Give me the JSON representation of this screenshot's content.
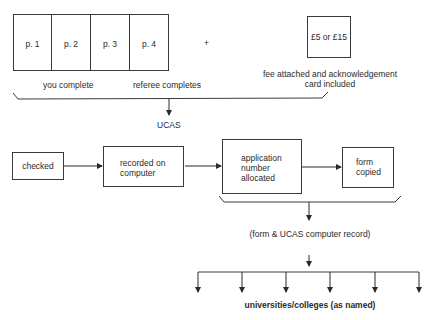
{
  "form_pages": [
    {
      "label": "p. 1"
    },
    {
      "label": "p. 2"
    },
    {
      "label": "p. 3"
    },
    {
      "label": "p. 4"
    }
  ],
  "plus_sign": "+",
  "fee_box": {
    "label": "£5 or £15"
  },
  "captions": {
    "you_complete": "you complete",
    "referee_completes": "referee completes",
    "fee_line1": "fee attached and acknowledgement",
    "fee_line2": "card included"
  },
  "ucas_label": "UCAS",
  "process_steps": [
    {
      "line1": "checked",
      "line2": "",
      "line3": ""
    },
    {
      "line1": "recorded on",
      "line2": "computer",
      "line3": ""
    },
    {
      "line1": "application",
      "line2": "number",
      "line3": "allocated"
    },
    {
      "line1": "form",
      "line2": "copied",
      "line3": ""
    }
  ],
  "record_label": "(form & UCAS computer record)",
  "destination_label": "universities/colleges (as named)",
  "destination_arrow_count": 6
}
